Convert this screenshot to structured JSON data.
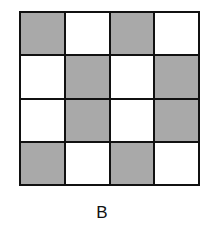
{
  "figure": {
    "label": "B",
    "rows": 4,
    "cols": 4,
    "cells": [
      [
        1,
        0,
        1,
        0
      ],
      [
        0,
        1,
        0,
        1
      ],
      [
        0,
        1,
        0,
        1
      ],
      [
        1,
        0,
        1,
        0
      ]
    ],
    "colors": {
      "shaded": "#a9a9a9",
      "empty": "#ffffff",
      "border": "#111111"
    }
  }
}
